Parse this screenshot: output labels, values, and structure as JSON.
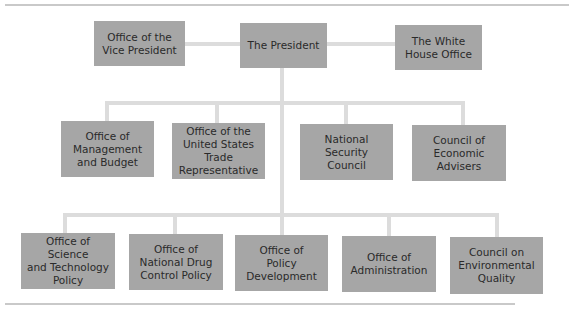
{
  "top_row": {
    "vice_president": "Office of the\nVice President",
    "president": "The President",
    "white_house": "The White\nHouse Office"
  },
  "second_row": [
    "Office of\nManagement\nand Budget",
    "Office of the\nUnited States\nTrade\nRepresentative",
    "National\nSecurity\nCouncil",
    "Council of\nEconomic\nAdvisers"
  ],
  "third_row": [
    "Office of Science\nand Technology\nPolicy",
    "Office of\nNational Drug\nControl Policy",
    "Office of\nPolicy\nDevelopment",
    "Office of\nAdministration",
    "Council on\nEnvironmental\nQuality"
  ],
  "colors": {
    "box": "#a6a6a6",
    "connector": "#dcdcdc",
    "rule": "#c9c9c9",
    "text": "#2a2a2a"
  }
}
